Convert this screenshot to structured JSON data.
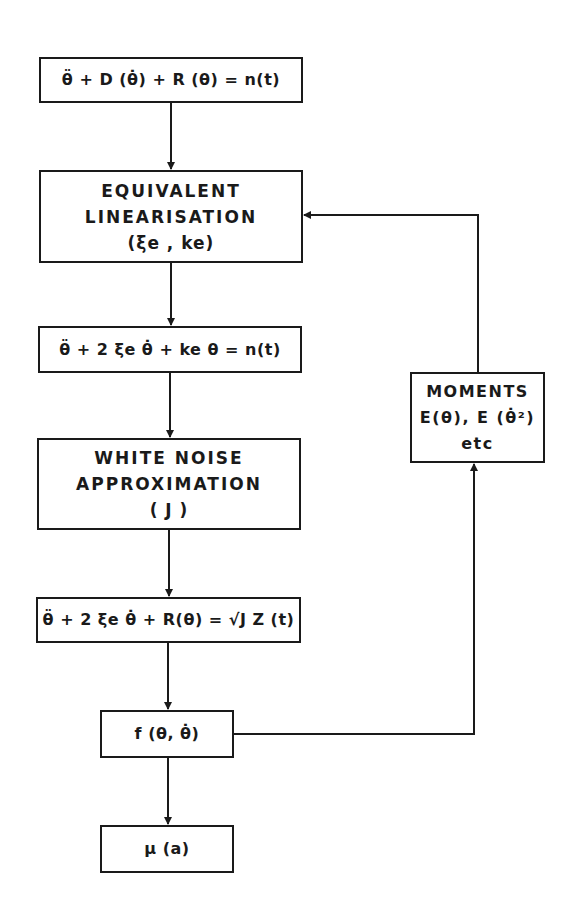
{
  "diagram": {
    "type": "flowchart",
    "boxes": {
      "equation_of_motion": {
        "lines": [
          "θ̈ + D (θ̇) + R (θ) = n(t)"
        ]
      },
      "equivalent_linearisation": {
        "lines": [
          "EQUIVALENT",
          "LINEARISATION",
          "(ξe , ke)"
        ]
      },
      "linearised_equation": {
        "lines": [
          "θ̈ + 2 ξe θ̇ + ke θ = n(t)"
        ]
      },
      "white_noise_approximation": {
        "lines": [
          "WHITE NOISE",
          "APPROXIMATION",
          "( J )"
        ]
      },
      "approximated_equation": {
        "lines": [
          "θ̈ + 2 ξe θ̇ + R(θ) = √J Z (t)"
        ]
      },
      "probability_density": {
        "lines": [
          "f (θ, θ̇)"
        ]
      },
      "result": {
        "lines": [
          "μ (a)"
        ]
      },
      "moments": {
        "lines": [
          "MOMENTS",
          "E(θ), E (θ̇²)",
          "etc"
        ]
      }
    },
    "edges": [
      {
        "from": "equation_of_motion",
        "to": "equivalent_linearisation"
      },
      {
        "from": "equivalent_linearisation",
        "to": "linearised_equation"
      },
      {
        "from": "linearised_equation",
        "to": "white_noise_approximation"
      },
      {
        "from": "white_noise_approximation",
        "to": "approximated_equation"
      },
      {
        "from": "approximated_equation",
        "to": "probability_density"
      },
      {
        "from": "probability_density",
        "to": "result"
      },
      {
        "from": "probability_density",
        "to": "moments"
      },
      {
        "from": "moments",
        "to": "equivalent_linearisation",
        "label": "feedback"
      }
    ],
    "colors": {
      "stroke": "#1a1a1a",
      "background": "#ffffff"
    }
  }
}
